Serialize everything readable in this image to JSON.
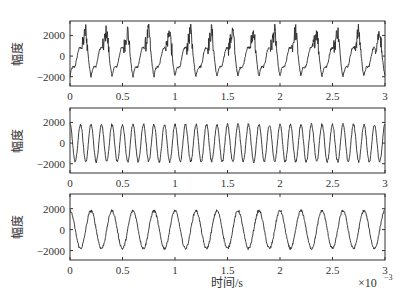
{
  "chart_data": [
    {
      "type": "line",
      "title": "",
      "xlabel": "",
      "ylabel": "幅度",
      "xlim": [
        0,
        3
      ],
      "ylim": [
        -2900,
        3400
      ],
      "x_ticks": [
        "0",
        "0.5",
        "1",
        "1.5",
        "2",
        "2.5",
        "3"
      ],
      "y_ticks": [
        "2000",
        "0",
        "−2000"
      ],
      "grid": false,
      "description": "Composite signal: ~5 kHz triangle-like wave with noisy high-frequency bursts near peaks, ~15 cycles over 3e-3 s, amplitude about −2000 to 3000",
      "series": [
        {
          "name": "signal",
          "frequency_hz": 5000,
          "amplitude_min": -2000,
          "amplitude_max": 3000
        }
      ]
    },
    {
      "type": "line",
      "title": "",
      "xlabel": "",
      "ylabel": "幅度",
      "xlim": [
        0,
        3
      ],
      "ylim": [
        -2900,
        3400
      ],
      "x_ticks": [
        "0",
        "0.5",
        "1",
        "1.5",
        "2",
        "2.5",
        "3"
      ],
      "y_ticks": [
        "2000",
        "0",
        "−2000"
      ],
      "grid": false,
      "description": "Sinusoid ~10 kHz, ~30 cycles over 3e-3 s, amplitude about ±1800",
      "series": [
        {
          "name": "signal",
          "frequency_hz": 10000,
          "amplitude": 1800
        }
      ]
    },
    {
      "type": "line",
      "title": "",
      "xlabel": "时间/s",
      "ylabel": "幅度",
      "xlim": [
        0,
        3
      ],
      "ylim": [
        -2900,
        3400
      ],
      "x_ticks": [
        "0",
        "0.5",
        "1",
        "1.5",
        "2",
        "2.5",
        "3"
      ],
      "x_scale_note": "×10⁻³",
      "y_ticks": [
        "2000",
        "0",
        "−2000"
      ],
      "grid": false,
      "description": "Sinusoid ~5 kHz, ~15 cycles over 3e-3 s, amplitude about ±1800",
      "series": [
        {
          "name": "signal",
          "frequency_hz": 5000,
          "amplitude": 1800
        }
      ]
    }
  ],
  "labels": {
    "ylabel": "幅度",
    "xlabel": "时间/s",
    "x_scale": "×10",
    "x_scale_exp": "−3",
    "x_ticks": [
      "0",
      "0.5",
      "1",
      "1.5",
      "2",
      "2.5",
      "3"
    ],
    "y_ticks": [
      "2000",
      "0",
      "−2000"
    ]
  }
}
